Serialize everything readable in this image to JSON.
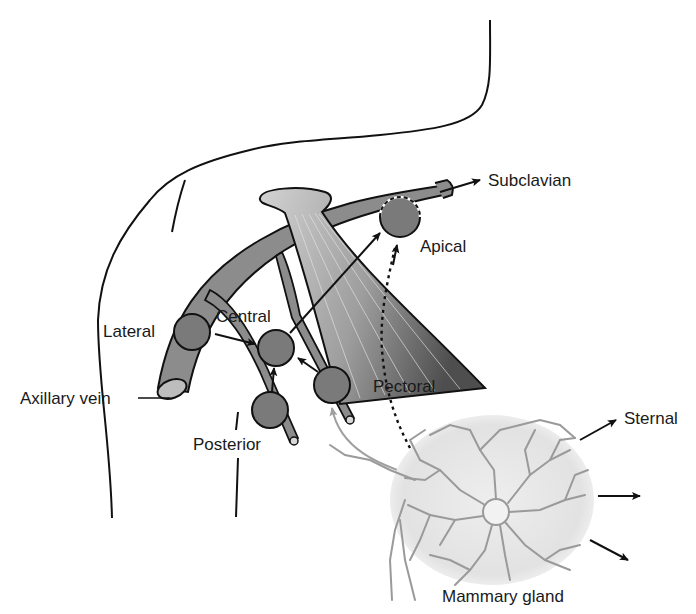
{
  "labels": {
    "subclavian": "Subclavian",
    "apical": "Apical",
    "lateral": "Lateral",
    "central": "Central",
    "axillary_vein": "Axillary vein",
    "pectoral": "Pectoral",
    "posterior": "Posterior",
    "sternal": "Sternal",
    "mammary_gland": "Mammary gland"
  },
  "colors": {
    "outline": "#111111",
    "vein_fill": "#8c8c8c",
    "node_fill": "#7a7a7a",
    "muscle_light": "#c8c8c8",
    "muscle_dark": "#5a5a5a",
    "gland_ducts": "#9a9a9a",
    "gland_bg": "#e6e6e6",
    "lymph_arrow": "#a0a0a0"
  }
}
